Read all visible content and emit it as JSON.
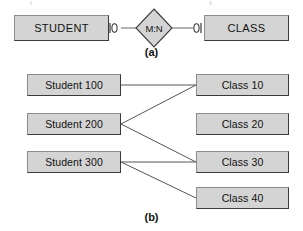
{
  "figure": {
    "width": 303,
    "height": 231,
    "background": "#ffffff",
    "box_fill": "#d4d4d4",
    "box_stroke": "#3a3a3a",
    "line_color": "#555555",
    "text_color": "#111111"
  },
  "panel_a": {
    "label": "(a)",
    "entities": [
      {
        "name": "student-entity",
        "text": "STUDENT"
      },
      {
        "name": "class-entity",
        "text": "CLASS"
      }
    ],
    "relationship": {
      "name": "m-n-relationship-diamond",
      "text": "M:N"
    },
    "connectors": [
      {
        "name": "optional-one-connector-left",
        "symbol": "|o"
      },
      {
        "name": "optional-one-connector-right",
        "symbol": "o|"
      }
    ]
  },
  "panel_b": {
    "label": "(b)",
    "students": [
      {
        "id": "student-100",
        "text": "Student 100"
      },
      {
        "id": "student-200",
        "text": "Student 200"
      },
      {
        "id": "student-300",
        "text": "Student 300"
      }
    ],
    "classes": [
      {
        "id": "class-10",
        "text": "Class 10"
      },
      {
        "id": "class-20",
        "text": "Class 20"
      },
      {
        "id": "class-30",
        "text": "Class 30"
      },
      {
        "id": "class-40",
        "text": "Class 40"
      }
    ],
    "links": [
      {
        "from": "student-100",
        "to": "class-10"
      },
      {
        "from": "student-200",
        "to": "class-10"
      },
      {
        "from": "student-200",
        "to": "class-30"
      },
      {
        "from": "student-300",
        "to": "class-30"
      },
      {
        "from": "student-300",
        "to": "class-40"
      }
    ]
  }
}
